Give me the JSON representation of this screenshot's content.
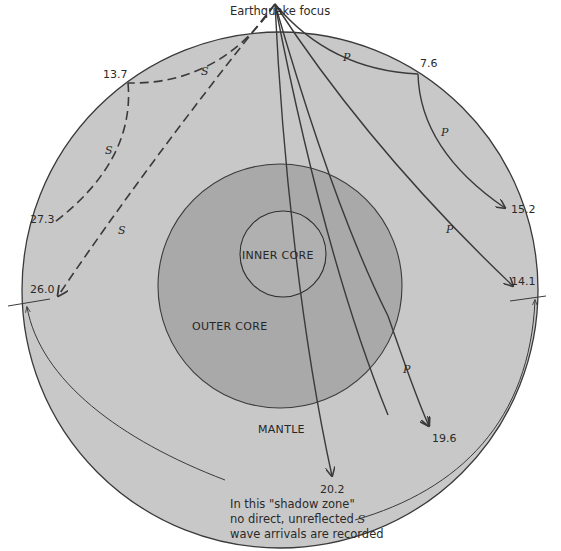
{
  "title": "Earthquake focus",
  "regions": {
    "inner_core": "INNER CORE",
    "outer_core": "OUTER CORE",
    "mantle": "MANTLE"
  },
  "colors": {
    "mantle_fill": "#c8c8c8",
    "outer_core_fill": "#a9a9a9",
    "inner_core_fill": "#b3b3b3",
    "line": "#3a3a3a",
    "background": "#ffffff"
  },
  "wave_labels": {
    "s": "S",
    "p": "P"
  },
  "arrival_times": {
    "p_7_6": "7.6",
    "p_15_2": "15.2",
    "p_14_1": "14.1",
    "p_19_6": "19.6",
    "p_20_2": "20.2",
    "s_13_7": "13.7",
    "s_27_3": "27.3",
    "s_26_0": "26.0"
  },
  "caption": {
    "line1": "In this \"shadow zone\"",
    "line2_pre": "no direct, unreflected ",
    "line2_italic": "S",
    "line3": "wave arrivals are recorded"
  }
}
